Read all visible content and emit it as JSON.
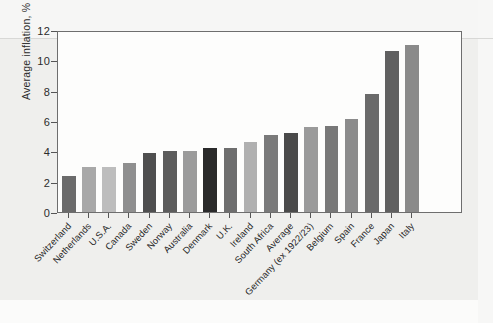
{
  "chart_data": {
    "type": "bar",
    "title": "",
    "subtitle": "",
    "xlabel": "",
    "ylabel": "Average inflation, %",
    "ylim": [
      0,
      12
    ],
    "yticks": [
      0,
      2,
      4,
      6,
      8,
      10,
      12
    ],
    "ytick_labels": [
      "0",
      "2",
      "4",
      "6",
      "8",
      "10",
      "12"
    ],
    "grid": false,
    "legend": "none",
    "categories": [
      "Switzerland",
      "Netherlands",
      "U.S.A.",
      "Canada",
      "Sweden",
      "Norway",
      "Australia",
      "Denmark",
      "U.K.",
      "Ireland",
      "South Africa",
      "Average",
      "Germany (ex 1922/23)",
      "Belgium",
      "Spain",
      "France",
      "Japan",
      "Italy"
    ],
    "values": [
      2.4,
      3.0,
      3.0,
      3.2,
      3.9,
      4.0,
      4.0,
      4.2,
      4.2,
      4.6,
      5.1,
      5.2,
      5.6,
      5.7,
      6.1,
      7.8,
      10.6,
      11.0
    ],
    "bar_colors": [
      "#6b6b6b",
      "#a8a8a8",
      "#bdbdbd",
      "#8f8f8f",
      "#4f4f4f",
      "#5c5c5c",
      "#9b9b9b",
      "#2a2a2a",
      "#6e6e6e",
      "#b0b0b0",
      "#7a7a7a",
      "#4a4a4a",
      "#9a9a9a",
      "#787878",
      "#8b8b8b",
      "#6a6a6a",
      "#606060",
      "#8a8a8a"
    ],
    "axis_color": "#6e6e6e",
    "plot_background": "#fdfdfc",
    "page_background": "#efefed"
  }
}
